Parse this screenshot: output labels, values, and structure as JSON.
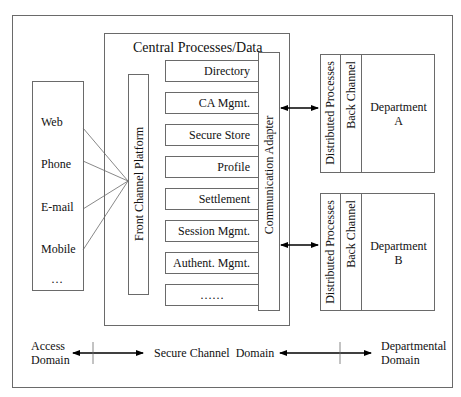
{
  "diagram": {
    "central": {
      "title": "Central Processes/Data",
      "front_channel": "Front Channel Platform",
      "communication_adapter": "Communication Adapter",
      "modules": [
        "Directory",
        "CA Mgmt.",
        "Secure Store",
        "Profile",
        "Settlement",
        "Session Mgmt.",
        "Authent. Mgmt.",
        "……"
      ]
    },
    "access_channels": [
      "Web",
      "Phone",
      "E-mail",
      "Mobile",
      "…"
    ],
    "departments": [
      {
        "distributed": "Distributed Processes",
        "back_channel": "Back Channel",
        "name_line1": "Department",
        "name_line2": "A"
      },
      {
        "distributed": "Distributed Processes",
        "back_channel": "Back Channel",
        "name_line1": "Department",
        "name_line2": "B"
      }
    ],
    "domains": {
      "access_line1": "Access",
      "access_line2": "Domain",
      "secure": "Secure Channel  Domain",
      "departmental_line1": "Departmental",
      "departmental_line2": "Domain"
    },
    "colors": {
      "line": "#6a6a6a",
      "arrow": "#000000",
      "background": "#ffffff"
    }
  }
}
